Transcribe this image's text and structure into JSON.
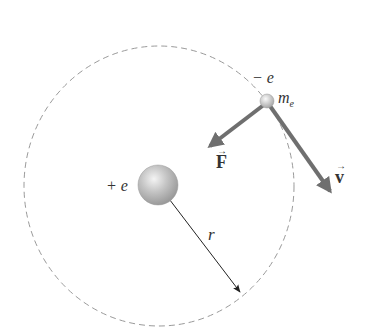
{
  "diagram": {
    "type": "bohr-atom-orbit",
    "colors": {
      "orbit": "#9a9a9a",
      "vector_arrow": "#6f6f6f",
      "radius_arrow": "#222222",
      "nucleus": "#b8b8b8",
      "electron": "#cfcfcf",
      "text": "#333333"
    },
    "nucleus": {
      "charge_label": "+ e"
    },
    "electron": {
      "charge_label": "− e",
      "mass_label_main": "m",
      "mass_label_sub": "e"
    },
    "force_vector": {
      "label": "F",
      "arrow": "→"
    },
    "velocity_vector": {
      "label": "v",
      "arrow": "→"
    },
    "radius": {
      "label": "r"
    }
  }
}
